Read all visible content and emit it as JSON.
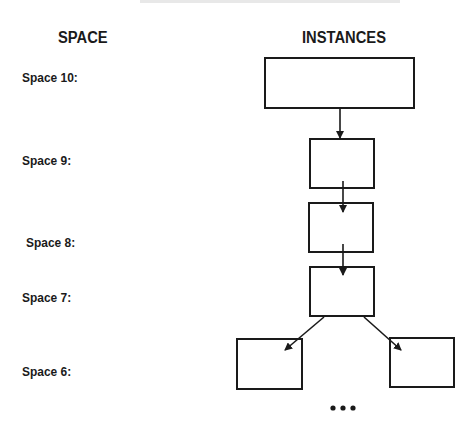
{
  "headers": {
    "space": "SPACE",
    "instances": "INSTANCES"
  },
  "space_labels": [
    {
      "label": "Space 10:"
    },
    {
      "label": "Space 9:"
    },
    {
      "label": "Space 8:"
    },
    {
      "label": "Space 7:"
    },
    {
      "label": "Space 6:"
    }
  ],
  "instances": [
    {
      "id": "instance-space-10",
      "level": 10
    },
    {
      "id": "instance-space-9",
      "level": 9
    },
    {
      "id": "instance-space-8",
      "level": 8
    },
    {
      "id": "instance-space-7",
      "level": 7
    },
    {
      "id": "instance-space-6-left",
      "level": 6
    },
    {
      "id": "instance-space-6-right",
      "level": 6
    }
  ],
  "edges": [
    {
      "from": "instance-space-10",
      "to": "instance-space-9"
    },
    {
      "from": "instance-space-9",
      "to": "instance-space-8"
    },
    {
      "from": "instance-space-8",
      "to": "instance-space-7"
    },
    {
      "from": "instance-space-7",
      "to": "instance-space-6-left"
    },
    {
      "from": "instance-space-7",
      "to": "instance-space-6-right"
    }
  ],
  "continuation": "•••",
  "colors": {
    "stroke": "#1a1a1a",
    "background": "#ffffff"
  }
}
